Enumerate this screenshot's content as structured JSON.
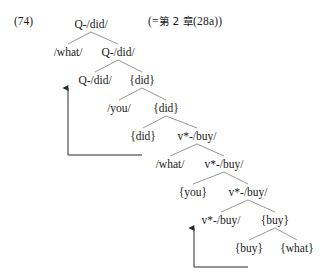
{
  "page": {
    "top_remnant": "",
    "example_number": "(74)",
    "cross_reference_open": "(=",
    "cross_reference_cjk": "第 2 章",
    "cross_reference_tail": "(28a))",
    "ink_color": "#1a1a1a",
    "line_color": "#8a8a8a",
    "arrow_color": "#2b2b2b",
    "background": "#ffffff"
  },
  "tree": {
    "description": "Binary-branching derivational syntax tree with phonological spell-out labels",
    "nodes": [
      {
        "id": "n1",
        "label": "Q-/did/",
        "level": 1,
        "x": 91,
        "y": 24
      },
      {
        "id": "n2",
        "label": "/what/",
        "level": 2,
        "x": 68,
        "y": 52
      },
      {
        "id": "n3",
        "label": "Q-/did/",
        "level": 2,
        "x": 118,
        "y": 52
      },
      {
        "id": "n4",
        "label": "Q-/did/",
        "level": 3,
        "x": 95,
        "y": 80
      },
      {
        "id": "n5",
        "label": "{did}",
        "level": 3,
        "x": 142,
        "y": 80
      },
      {
        "id": "n6",
        "label": "/you/",
        "level": 4,
        "x": 119,
        "y": 108
      },
      {
        "id": "n7",
        "label": "{did}",
        "level": 4,
        "x": 166,
        "y": 108
      },
      {
        "id": "n8",
        "label": "{did}",
        "level": 5,
        "x": 143,
        "y": 136
      },
      {
        "id": "n9",
        "label": "v*-/buy/",
        "level": 5,
        "x": 197,
        "y": 136
      },
      {
        "id": "n10",
        "label": "/what/",
        "level": 6,
        "x": 170,
        "y": 164
      },
      {
        "id": "n11",
        "label": "v*-/buy/",
        "level": 6,
        "x": 224,
        "y": 164
      },
      {
        "id": "n12",
        "label": "{you}",
        "level": 7,
        "x": 193,
        "y": 192
      },
      {
        "id": "n13",
        "label": "v*-/buy/",
        "level": 7,
        "x": 248,
        "y": 192
      },
      {
        "id": "n14",
        "label": "v*-/buy/",
        "level": 8,
        "x": 221,
        "y": 220
      },
      {
        "id": "n15",
        "label": "{buy}",
        "level": 8,
        "x": 275,
        "y": 220
      },
      {
        "id": "n16",
        "label": "{buy}",
        "level": 9,
        "x": 249,
        "y": 248
      },
      {
        "id": "n17",
        "label": "{what}",
        "level": 9,
        "x": 297,
        "y": 248
      }
    ],
    "branches": [
      {
        "from": "n1",
        "to": "n2"
      },
      {
        "from": "n1",
        "to": "n3"
      },
      {
        "from": "n3",
        "to": "n4"
      },
      {
        "from": "n3",
        "to": "n5"
      },
      {
        "from": "n5",
        "to": "n6"
      },
      {
        "from": "n5",
        "to": "n7"
      },
      {
        "from": "n7",
        "to": "n8"
      },
      {
        "from": "n7",
        "to": "n9"
      },
      {
        "from": "n9",
        "to": "n10"
      },
      {
        "from": "n9",
        "to": "n11"
      },
      {
        "from": "n11",
        "to": "n12"
      },
      {
        "from": "n11",
        "to": "n13"
      },
      {
        "from": "n13",
        "to": "n14"
      },
      {
        "from": "n13",
        "to": "n15"
      },
      {
        "from": "n15",
        "to": "n16"
      },
      {
        "from": "n15",
        "to": "n17"
      }
    ],
    "movements": [
      {
        "name": "did-movement",
        "from_label": "{did}",
        "to_label": "Q-/did/",
        "from": "n8",
        "to": "n4"
      },
      {
        "name": "buy-movement",
        "from_label": "{buy}",
        "to_label": "v*-/buy/",
        "from": "n16",
        "to": "n14"
      }
    ]
  }
}
